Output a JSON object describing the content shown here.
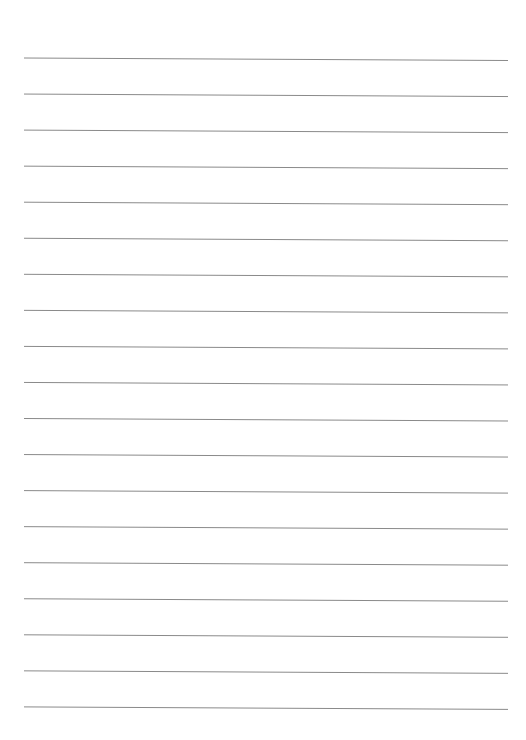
{
  "document": {
    "type": "lined-paper",
    "line_count": 19,
    "line_color": "#8a8a8a",
    "background_color": "#ffffff"
  }
}
